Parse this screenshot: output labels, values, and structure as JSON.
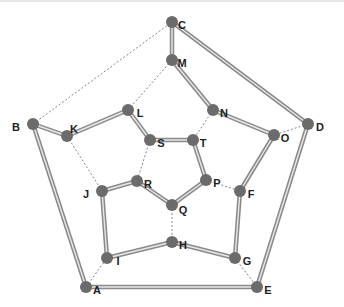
{
  "diagram": {
    "type": "graph",
    "colors": {
      "node": "#6b6b6b",
      "cycle_edge_outer": "#8a8a8a",
      "cycle_edge_inner": "#e8e8e8",
      "dashed_edge": "#666666",
      "label": "#222222"
    },
    "nodes": [
      {
        "id": "C",
        "x": 172,
        "y": 22,
        "lx": 182,
        "ly": 26
      },
      {
        "id": "M",
        "x": 172,
        "y": 60,
        "lx": 182,
        "ly": 64
      },
      {
        "id": "L",
        "x": 128,
        "y": 110,
        "lx": 140,
        "ly": 114
      },
      {
        "id": "N",
        "x": 213,
        "y": 110,
        "lx": 224,
        "ly": 114
      },
      {
        "id": "B",
        "x": 33,
        "y": 124,
        "lx": 16,
        "ly": 128
      },
      {
        "id": "D",
        "x": 308,
        "y": 124,
        "lx": 320,
        "ly": 128
      },
      {
        "id": "K",
        "x": 67,
        "y": 136,
        "lx": 74,
        "ly": 130
      },
      {
        "id": "S",
        "x": 150,
        "y": 140,
        "lx": 161,
        "ly": 144
      },
      {
        "id": "T",
        "x": 193,
        "y": 140,
        "lx": 203,
        "ly": 144
      },
      {
        "id": "O",
        "x": 274,
        "y": 135,
        "lx": 285,
        "ly": 139
      },
      {
        "id": "J",
        "x": 102,
        "y": 191,
        "lx": 86,
        "ly": 195
      },
      {
        "id": "R",
        "x": 137,
        "y": 181,
        "lx": 148,
        "ly": 185
      },
      {
        "id": "P",
        "x": 206,
        "y": 180,
        "lx": 217,
        "ly": 184
      },
      {
        "id": "F",
        "x": 240,
        "y": 191,
        "lx": 251,
        "ly": 195
      },
      {
        "id": "Q",
        "x": 172,
        "y": 205,
        "lx": 183,
        "ly": 211
      },
      {
        "id": "H",
        "x": 172,
        "y": 242,
        "lx": 183,
        "ly": 246
      },
      {
        "id": "I",
        "x": 107,
        "y": 258,
        "lx": 118,
        "ly": 262
      },
      {
        "id": "G",
        "x": 235,
        "y": 258,
        "lx": 247,
        "ly": 262
      },
      {
        "id": "A",
        "x": 86,
        "y": 287,
        "lx": 97,
        "ly": 291
      },
      {
        "id": "E",
        "x": 257,
        "y": 287,
        "lx": 268,
        "ly": 291
      }
    ],
    "cycle_edges": [
      [
        "C",
        "M"
      ],
      [
        "M",
        "N"
      ],
      [
        "N",
        "O"
      ],
      [
        "O",
        "F"
      ],
      [
        "F",
        "G"
      ],
      [
        "G",
        "H"
      ],
      [
        "H",
        "I"
      ],
      [
        "I",
        "J"
      ],
      [
        "J",
        "R"
      ],
      [
        "R",
        "Q"
      ],
      [
        "Q",
        "P"
      ],
      [
        "P",
        "T"
      ],
      [
        "T",
        "S"
      ],
      [
        "S",
        "L"
      ],
      [
        "L",
        "K"
      ],
      [
        "K",
        "B"
      ],
      [
        "B",
        "A"
      ],
      [
        "A",
        "E"
      ],
      [
        "E",
        "D"
      ],
      [
        "D",
        "C"
      ]
    ],
    "dashed_edges": [
      [
        "B",
        "C"
      ],
      [
        "L",
        "M"
      ],
      [
        "N",
        "T"
      ],
      [
        "D",
        "O"
      ],
      [
        "P",
        "F"
      ],
      [
        "G",
        "E"
      ],
      [
        "A",
        "I"
      ],
      [
        "K",
        "J"
      ],
      [
        "S",
        "R"
      ],
      [
        "Q",
        "H"
      ]
    ]
  }
}
